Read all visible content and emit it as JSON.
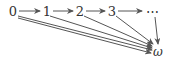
{
  "diagram": {
    "type": "directed-graph",
    "nodes": [
      {
        "id": "n0",
        "label": "0"
      },
      {
        "id": "n1",
        "label": "1"
      },
      {
        "id": "n2",
        "label": "2"
      },
      {
        "id": "n3",
        "label": "3"
      },
      {
        "id": "ndots",
        "label": "⋯"
      },
      {
        "id": "nomega",
        "label": "ω"
      }
    ],
    "edges": [
      {
        "from": "n0",
        "to": "n1"
      },
      {
        "from": "n1",
        "to": "n2"
      },
      {
        "from": "n2",
        "to": "n3"
      },
      {
        "from": "n3",
        "to": "ndots"
      },
      {
        "from": "n0",
        "to": "nomega"
      },
      {
        "from": "n0",
        "to": "nomega"
      },
      {
        "from": "n1",
        "to": "nomega"
      },
      {
        "from": "n2",
        "to": "nomega"
      },
      {
        "from": "n3",
        "to": "nomega"
      },
      {
        "from": "ndots",
        "to": "nomega"
      }
    ],
    "colors": {
      "stroke": "#555555",
      "text": "#333333"
    }
  }
}
